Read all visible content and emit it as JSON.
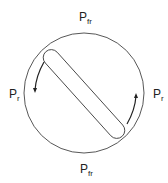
{
  "diagram": {
    "labels": {
      "top": {
        "main": "P",
        "sub": "fr"
      },
      "bottom": {
        "main": "P",
        "sub": "fr"
      },
      "left": {
        "main": "P",
        "sub": "r"
      },
      "right": {
        "main": "P",
        "sub": "r"
      }
    },
    "colors": {
      "stroke": "#333333",
      "background": "#ffffff"
    }
  }
}
